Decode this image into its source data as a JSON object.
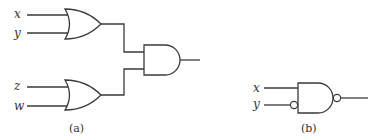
{
  "figure_a": {
    "caption": "(a)",
    "inputs": [
      "x",
      "y",
      "z",
      "w"
    ],
    "gates": [
      {
        "type": "OR",
        "inputs": [
          "x",
          "y"
        ]
      },
      {
        "type": "OR",
        "inputs": [
          "z",
          "w"
        ]
      },
      {
        "type": "AND",
        "inputs": [
          "OR1",
          "OR2"
        ]
      }
    ]
  },
  "figure_b": {
    "caption": "(b)",
    "inputs": [
      "x",
      "y"
    ],
    "gates": [
      {
        "type": "NAND",
        "inputs": [
          "x",
          "NOT y"
        ]
      }
    ]
  },
  "colors": {
    "stroke": "#3a3a3a",
    "text": "#333333",
    "background": "#ffffff"
  }
}
